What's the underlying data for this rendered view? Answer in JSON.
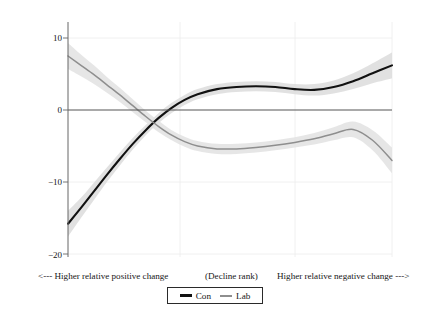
{
  "chart_data": {
    "type": "line",
    "title": "",
    "xlabel": "(Decline rank)",
    "ylabel": "Change in vote share, 1979–2019 (%)",
    "xlabel_left": "<--- Higher relative positive change",
    "xlabel_right": "Higher relative negative change --->",
    "ylim": [
      -21,
      13
    ],
    "xlim": [
      0,
      100
    ],
    "yticks": [
      10,
      0,
      -10,
      -20
    ],
    "ytick_labels": [
      "10",
      "0",
      "−10",
      "−20"
    ],
    "grid": "light-gray vertical and horizontal gridlines",
    "legend_position": "bottom-center",
    "zero_line": 0,
    "series": [
      {
        "name": "Con",
        "color": "#111111",
        "band_color": "#dcdcdc",
        "x": [
          0,
          4,
          8,
          12,
          16,
          20,
          24,
          28,
          32,
          36,
          40,
          46,
          52,
          58,
          64,
          70,
          76,
          82,
          88,
          94,
          100
        ],
        "values": [
          -15.8,
          -13.6,
          -11.3,
          -9.0,
          -6.8,
          -4.7,
          -2.8,
          -1.1,
          0.3,
          1.4,
          2.2,
          2.9,
          3.2,
          3.3,
          3.2,
          2.9,
          2.8,
          3.2,
          4.0,
          5.1,
          6.2
        ],
        "band_lower": [
          -17.6,
          -15.0,
          -12.5,
          -10.0,
          -7.7,
          -5.5,
          -3.5,
          -1.8,
          -0.4,
          0.7,
          1.5,
          2.2,
          2.5,
          2.6,
          2.5,
          2.2,
          2.0,
          2.3,
          2.9,
          3.7,
          4.4
        ],
        "band_upper": [
          -14.0,
          -12.2,
          -10.1,
          -8.0,
          -5.9,
          -3.9,
          -2.1,
          -0.4,
          1.0,
          2.1,
          2.9,
          3.6,
          3.9,
          4.0,
          3.9,
          3.6,
          3.6,
          4.1,
          5.1,
          6.5,
          8.0
        ]
      },
      {
        "name": "Lab",
        "color": "#8e8e8e",
        "band_color": "#e2e2e2",
        "x": [
          0,
          4,
          8,
          12,
          16,
          20,
          24,
          28,
          32,
          36,
          40,
          46,
          52,
          58,
          64,
          70,
          76,
          82,
          88,
          94,
          100
        ],
        "values": [
          7.5,
          6.2,
          4.9,
          3.5,
          2.1,
          0.6,
          -0.9,
          -2.3,
          -3.5,
          -4.4,
          -5.0,
          -5.4,
          -5.4,
          -5.2,
          -4.9,
          -4.5,
          -4.0,
          -3.3,
          -2.7,
          -4.2,
          -7.0
        ],
        "band_lower": [
          5.7,
          4.7,
          3.6,
          2.4,
          1.1,
          -0.3,
          -1.7,
          -3.1,
          -4.2,
          -5.1,
          -5.7,
          -6.1,
          -6.1,
          -5.9,
          -5.6,
          -5.2,
          -4.8,
          -4.2,
          -3.8,
          -5.6,
          -8.8
        ],
        "band_upper": [
          9.3,
          7.7,
          6.2,
          4.6,
          3.1,
          1.5,
          -0.1,
          -1.5,
          -2.8,
          -3.7,
          -4.3,
          -4.7,
          -4.7,
          -4.5,
          -4.2,
          -3.8,
          -3.2,
          -2.4,
          -1.6,
          -2.8,
          -5.2
        ]
      }
    ],
    "annotations": {
      "crossover_note": "Con and Lab curves cross near rank 30 at about -2.4%"
    }
  },
  "legend": {
    "items": [
      {
        "label": "Con"
      },
      {
        "label": "Lab"
      }
    ]
  }
}
